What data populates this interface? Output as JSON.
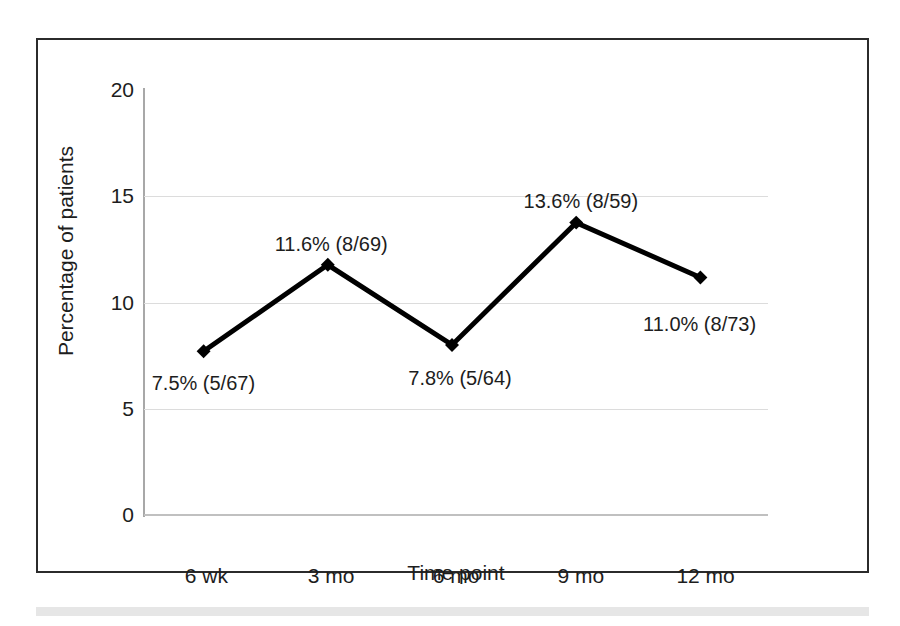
{
  "figure": {
    "frame_color": "#2b2b2b",
    "background": "#ffffff",
    "band_color": "#e6e6e6"
  },
  "chart_data": {
    "type": "line",
    "title": "",
    "subtitle": "",
    "xlabel": "Time point",
    "ylabel": "Percentage of patients",
    "categories": [
      "6 wk",
      "3 mo",
      "6 mo",
      "9 mo",
      "12 mo"
    ],
    "values": [
      7.5,
      11.6,
      7.8,
      13.6,
      11.0
    ],
    "point_labels": [
      "7.5% (5/67)",
      "11.6% (8/69)",
      "7.8% (5/64)",
      "13.6% (8/59)",
      "11.0% (8/73)"
    ],
    "numerators": [
      5,
      8,
      5,
      8,
      8
    ],
    "denominators": [
      67,
      69,
      64,
      59,
      73
    ],
    "ylim": [
      0,
      20
    ],
    "yticks": [
      0,
      5,
      10,
      15,
      20
    ],
    "ytick_labels": [
      "0",
      "5",
      "10",
      "15",
      "20"
    ],
    "grid": true,
    "gridlines_at": [
      5,
      10,
      15
    ],
    "legend": "none",
    "series_color": "#000000",
    "marker": "diamond",
    "line_width": 5
  }
}
